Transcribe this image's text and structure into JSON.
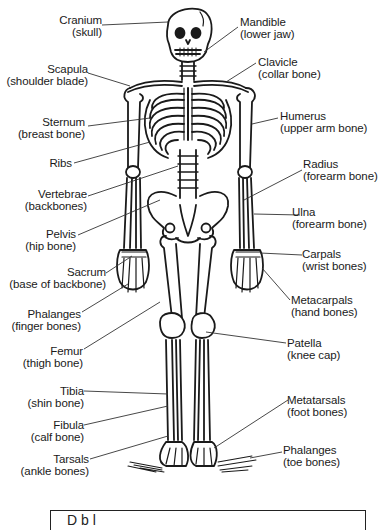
{
  "diagram": {
    "labels_left": [
      {
        "id": "cranium",
        "name": "Cranium",
        "common": "(skull)"
      },
      {
        "id": "scapula",
        "name": "Scapula",
        "common": "(shoulder blade)"
      },
      {
        "id": "sternum",
        "name": "Sternum",
        "common": "(breast bone)"
      },
      {
        "id": "ribs",
        "name": "Ribs",
        "common": ""
      },
      {
        "id": "vertebrae",
        "name": "Vertebrae",
        "common": "(backbones)"
      },
      {
        "id": "pelvis",
        "name": "Pelvis",
        "common": "(hip bone)"
      },
      {
        "id": "sacrum",
        "name": "Sacrum",
        "common": "(base of backbone)"
      },
      {
        "id": "phalanges-finger",
        "name": "Phalanges",
        "common": "(finger bones)"
      },
      {
        "id": "femur",
        "name": "Femur",
        "common": "(thigh bone)"
      },
      {
        "id": "tibia",
        "name": "Tibia",
        "common": "(shin bone)"
      },
      {
        "id": "fibula",
        "name": "Fibula",
        "common": "(calf bone)"
      },
      {
        "id": "tarsals",
        "name": "Tarsals",
        "common": "(ankle bones)"
      }
    ],
    "labels_right": [
      {
        "id": "mandible",
        "name": "Mandible",
        "common": "(lower jaw)"
      },
      {
        "id": "clavicle",
        "name": "Clavicle",
        "common": "(collar bone)"
      },
      {
        "id": "humerus",
        "name": "Humerus",
        "common": "(upper arm bone)"
      },
      {
        "id": "radius",
        "name": "Radius",
        "common": "(forearm bone)"
      },
      {
        "id": "ulna",
        "name": "Ulna",
        "common": "(forearm bone)"
      },
      {
        "id": "carpals",
        "name": "Carpals",
        "common": "(wrist bones)"
      },
      {
        "id": "metacarpals",
        "name": "Metacarpals",
        "common": "(hand bones)"
      },
      {
        "id": "patella",
        "name": "Patella",
        "common": "(knee cap)"
      },
      {
        "id": "metatarsals",
        "name": "Metatarsals",
        "common": "(foot bones)"
      },
      {
        "id": "phalanges-toe",
        "name": "Phalanges",
        "common": "(toe bones)"
      }
    ],
    "bottom_box_text": "D                  b               l"
  },
  "colors": {
    "ink": "#1a1a1a",
    "background": "#ffffff",
    "leader": "#333333"
  }
}
